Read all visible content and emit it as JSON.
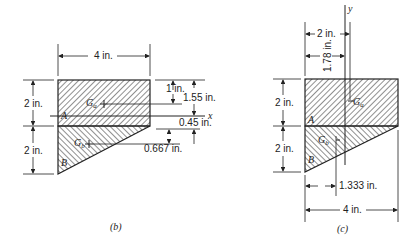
{
  "figure_b": {
    "caption": "(b)",
    "width_label": "4 in.",
    "upper_height_label": "2 in.",
    "lower_height_label": "2 in.",
    "dim_1in": "1 in.",
    "dim_155in": "1.55 in.",
    "dim_045in": "0.45 in.",
    "dim_0667in": "0.667 in.",
    "axis_x": "x",
    "region_a": "A",
    "region_b": "B",
    "centroid_a": "Ga",
    "centroid_b": "Gb"
  },
  "figure_c": {
    "caption": "(c)",
    "dim_2in_top": "2 in.",
    "dim_178in": "1.78 in.",
    "upper_height_label": "2 in.",
    "lower_height_label": "2 in.",
    "dim_1333in": "1.333 in.",
    "width_label": "4 in.",
    "axis_y": "y",
    "region_a": "A",
    "region_b": "B",
    "centroid_a": "Ga",
    "centroid_b": "Gb"
  },
  "colors": {
    "ink": "#222222",
    "background": "#ffffff"
  }
}
